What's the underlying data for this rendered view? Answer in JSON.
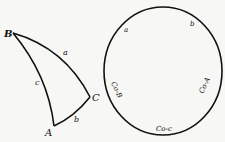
{
  "diagram": {
    "triangle": {
      "vertices": {
        "B": "B",
        "C": "C",
        "A": "A"
      },
      "sides": {
        "a": "a",
        "b": "b",
        "c": "c"
      }
    },
    "circle": {
      "parts": {
        "a": "a",
        "b": "b",
        "co_A": "Co-A",
        "co_c": "Co-c",
        "co_B": "Co-B"
      }
    },
    "colors": {
      "stroke": "#111111",
      "background": "#f7f7f5"
    }
  }
}
